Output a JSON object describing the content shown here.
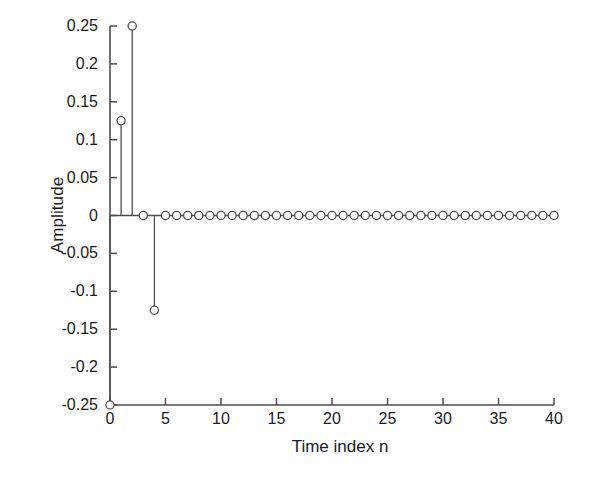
{
  "chart_data": {
    "type": "scatter",
    "plot_style": "stem",
    "title": "",
    "xlabel": "Time index n",
    "ylabel": "Amplitude",
    "xlim": [
      0,
      40
    ],
    "ylim": [
      -0.25,
      0.25
    ],
    "xticks": [
      0,
      5,
      10,
      15,
      20,
      25,
      30,
      35,
      40
    ],
    "xticklabels": [
      "0",
      "5",
      "10",
      "15",
      "20",
      "25",
      "30",
      "35",
      "40"
    ],
    "yticks": [
      0.25,
      0.2,
      0.15,
      0.1,
      0.05,
      0,
      -0.05,
      -0.1,
      -0.15,
      -0.2,
      -0.25
    ],
    "yticklabels": [
      "0.25",
      "0.2",
      "0.15",
      "0.1",
      "0.05",
      "0",
      "-0.05",
      "-0.1",
      "-0.15",
      "-0.2",
      "-0.25"
    ],
    "grid": false,
    "legend": null,
    "marker": "open-circle",
    "line_color": "#4d4d4d",
    "marker_edge_color": "#4d4d4d",
    "marker_face_color": "#ffffff",
    "background_color": "#ffffff",
    "x": [
      0,
      1,
      2,
      3,
      4,
      5,
      6,
      7,
      8,
      9,
      10,
      11,
      12,
      13,
      14,
      15,
      16,
      17,
      18,
      19,
      20,
      21,
      22,
      23,
      24,
      25,
      26,
      27,
      28,
      29,
      30,
      31,
      32,
      33,
      34,
      35,
      36,
      37,
      38,
      39,
      40
    ],
    "values": [
      -0.25,
      0.125,
      0.25,
      0,
      -0.125,
      0,
      0,
      0,
      0,
      0,
      0,
      0,
      0,
      0,
      0,
      0,
      0,
      0,
      0,
      0,
      0,
      0,
      0,
      0,
      0,
      0,
      0,
      0,
      0,
      0,
      0,
      0,
      0,
      0,
      0,
      0,
      0,
      0,
      0,
      0,
      0
    ],
    "nonzero_points": [
      {
        "n": 0,
        "amplitude": -0.25
      },
      {
        "n": 1,
        "amplitude": 0.125
      },
      {
        "n": 2,
        "amplitude": 0.25
      },
      {
        "n": 4,
        "amplitude": -0.125
      }
    ]
  }
}
